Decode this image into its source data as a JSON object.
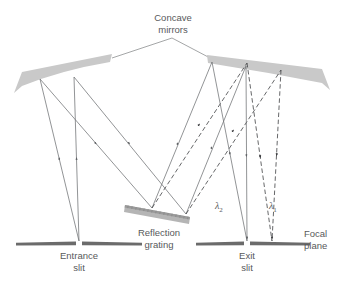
{
  "diagram": {
    "colors": {
      "ray_solid": "#6e7073",
      "ray_dashed": "#3f4043",
      "mirror_fill": "#c9c9c9",
      "grating_fill": "#b5b5b5",
      "slit_fill": "#6b6b6b",
      "text": "#58595b",
      "leader_line": "#8d8f91",
      "background": "#ffffff"
    },
    "labels": {
      "concave_mirrors": "Concave\nmirrors",
      "reflection_grating": "Reflection\ngrating",
      "entrance_slit": "Entrance\nslit",
      "exit_slit": "Exit\nslit",
      "focal_plane": "Focal\nplane",
      "lambda_2_symbol": "λ",
      "lambda_2_sub": "2",
      "lambda_1_symbol": "λ",
      "lambda_1_sub": "1"
    },
    "components": [
      {
        "name": "entrance-slit",
        "label": "Entrance slit",
        "kind": "slit"
      },
      {
        "name": "left-concave-mirror",
        "label": "Concave mirror",
        "kind": "mirror"
      },
      {
        "name": "reflection-grating",
        "label": "Reflection grating",
        "kind": "grating"
      },
      {
        "name": "right-concave-mirror",
        "label": "Concave mirror",
        "kind": "mirror"
      },
      {
        "name": "exit-slit",
        "label": "Exit slit",
        "kind": "slit"
      },
      {
        "name": "focal-plane",
        "label": "Focal plane",
        "kind": "plane"
      }
    ],
    "beams": [
      {
        "name": "source-to-left-mirror",
        "style": "solid",
        "wavelength": null
      },
      {
        "name": "left-mirror-to-grating",
        "style": "solid",
        "wavelength": null
      },
      {
        "name": "grating-to-right-mirror-lambda2",
        "style": "solid",
        "wavelength": "λ2"
      },
      {
        "name": "grating-to-right-mirror-lambda1",
        "style": "dashed",
        "wavelength": "λ1"
      },
      {
        "name": "right-mirror-to-focal-plane-lambda2",
        "style": "solid",
        "wavelength": "λ2"
      },
      {
        "name": "right-mirror-to-focal-plane-lambda1",
        "style": "dashed",
        "wavelength": "λ1"
      }
    ]
  }
}
